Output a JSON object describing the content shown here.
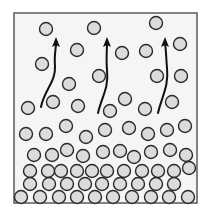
{
  "figure": {
    "frame": {
      "x": 14,
      "y": 13,
      "width": 183,
      "height": 190,
      "stroke": "#5a5a5a",
      "fill": "#f5f5f5"
    },
    "molecule_style": {
      "radius": 6.5,
      "fill": "#dcdcdc",
      "stroke": "#2a2a2a",
      "stroke_width": 1.4
    },
    "arrow_style": {
      "stroke": "#111111",
      "stroke_width": 2
    },
    "molecules": [
      {
        "x": 46,
        "y": 29
      },
      {
        "x": 94,
        "y": 28
      },
      {
        "x": 156,
        "y": 23
      },
      {
        "x": 77,
        "y": 50
      },
      {
        "x": 122,
        "y": 53
      },
      {
        "x": 146,
        "y": 51
      },
      {
        "x": 180,
        "y": 44
      },
      {
        "x": 42,
        "y": 64
      },
      {
        "x": 69,
        "y": 84
      },
      {
        "x": 99,
        "y": 76
      },
      {
        "x": 157,
        "y": 76
      },
      {
        "x": 181,
        "y": 76
      },
      {
        "x": 53,
        "y": 102
      },
      {
        "x": 28,
        "y": 108
      },
      {
        "x": 78,
        "y": 106
      },
      {
        "x": 125,
        "y": 99
      },
      {
        "x": 110,
        "y": 111
      },
      {
        "x": 145,
        "y": 109
      },
      {
        "x": 172,
        "y": 102
      },
      {
        "x": 26,
        "y": 134
      },
      {
        "x": 46,
        "y": 134
      },
      {
        "x": 66,
        "y": 126
      },
      {
        "x": 86,
        "y": 137
      },
      {
        "x": 105,
        "y": 130
      },
      {
        "x": 129,
        "y": 128
      },
      {
        "x": 148,
        "y": 134
      },
      {
        "x": 167,
        "y": 130
      },
      {
        "x": 185,
        "y": 126
      },
      {
        "x": 34,
        "y": 155
      },
      {
        "x": 52,
        "y": 155
      },
      {
        "x": 67,
        "y": 150
      },
      {
        "x": 83,
        "y": 156
      },
      {
        "x": 103,
        "y": 152
      },
      {
        "x": 120,
        "y": 151
      },
      {
        "x": 134,
        "y": 157
      },
      {
        "x": 151,
        "y": 152
      },
      {
        "x": 170,
        "y": 150
      },
      {
        "x": 186,
        "y": 155
      },
      {
        "x": 30,
        "y": 171
      },
      {
        "x": 48,
        "y": 171
      },
      {
        "x": 61,
        "y": 171
      },
      {
        "x": 77,
        "y": 171
      },
      {
        "x": 92,
        "y": 171
      },
      {
        "x": 107,
        "y": 171
      },
      {
        "x": 124,
        "y": 171
      },
      {
        "x": 142,
        "y": 171
      },
      {
        "x": 158,
        "y": 171
      },
      {
        "x": 174,
        "y": 171
      },
      {
        "x": 189,
        "y": 168
      },
      {
        "x": 30,
        "y": 184
      },
      {
        "x": 49,
        "y": 184
      },
      {
        "x": 67,
        "y": 184
      },
      {
        "x": 85,
        "y": 184
      },
      {
        "x": 102,
        "y": 184
      },
      {
        "x": 120,
        "y": 184
      },
      {
        "x": 138,
        "y": 184
      },
      {
        "x": 156,
        "y": 184
      },
      {
        "x": 174,
        "y": 184
      },
      {
        "x": 21,
        "y": 197
      },
      {
        "x": 40,
        "y": 197
      },
      {
        "x": 59,
        "y": 197
      },
      {
        "x": 77,
        "y": 197
      },
      {
        "x": 95,
        "y": 197
      },
      {
        "x": 113,
        "y": 197
      },
      {
        "x": 132,
        "y": 197
      },
      {
        "x": 151,
        "y": 197
      },
      {
        "x": 169,
        "y": 197
      },
      {
        "x": 188,
        "y": 197
      }
    ],
    "arrows": [
      {
        "name": "escape-arrow-left",
        "path": "M 41 107 C 44 90, 56 82, 55 66 C 54 56, 56 48, 56 44",
        "tip": [
          56,
          37
        ]
      },
      {
        "name": "escape-arrow-middle",
        "path": "M 98 113 C 102 96, 109 88, 107 70 C 106 58, 107 50, 107 44",
        "tip": [
          107,
          37
        ]
      },
      {
        "name": "escape-arrow-right",
        "path": "M 158 113 C 162 96, 169 86, 167 68 C 166 56, 166 48, 165 44",
        "tip": [
          165,
          37
        ]
      }
    ]
  }
}
